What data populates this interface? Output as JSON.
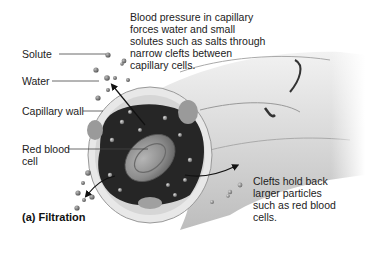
{
  "diagram": {
    "labels": {
      "solute": "Solute",
      "water": "Water",
      "capillary_wall": "Capillary wall",
      "red_blood_cell_line1": "Red blood",
      "red_blood_cell_line2": "cell"
    },
    "annotations": {
      "top_line1": "Blood pressure in capillary",
      "top_line2": "forces water and small",
      "top_line3": "solutes such as salts through",
      "top_line4": "narrow clefts between",
      "top_line5": "capillary cells.",
      "right_line1": "Clefts hold back",
      "right_line2": "larger particles",
      "right_line3": "such as red blood",
      "right_line4": "cells."
    },
    "caption": "(a) Filtration",
    "colors": {
      "background": "#ffffff",
      "vessel_light": "#e6e6e6",
      "vessel_mid": "#c8c8c8",
      "lumen_dark": "#222222",
      "rbc": "#8a8a8a",
      "text": "#222222"
    }
  }
}
